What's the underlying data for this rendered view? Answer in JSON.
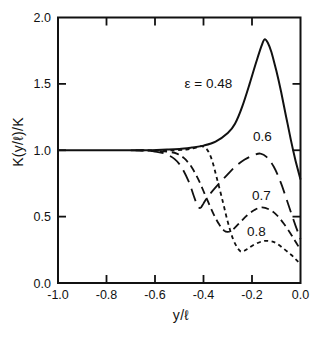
{
  "colors": {
    "ink": "#111111",
    "background": "#ffffff"
  },
  "chart_data": {
    "type": "line",
    "title": "",
    "xlabel": "y/ℓ",
    "ylabel": "K(y/ℓ)/K",
    "xlim": [
      -1.0,
      0.0
    ],
    "ylim": [
      0.0,
      2.0
    ],
    "grid": false,
    "legend_position": "inline-annotations",
    "x_ticks": [
      {
        "label": "-1.0",
        "value": -1.0
      },
      {
        "label": "-0.8",
        "value": -0.8
      },
      {
        "label": "-0.6",
        "value": -0.6
      },
      {
        "label": "-0.4",
        "value": -0.4
      },
      {
        "label": "-0.2",
        "value": -0.2
      },
      {
        "label": "0.0",
        "value": 0.0
      }
    ],
    "y_ticks": [
      {
        "label": "0.0",
        "value": 0.0
      },
      {
        "label": "0.5",
        "value": 0.5
      },
      {
        "label": "1.0",
        "value": 1.0
      },
      {
        "label": "1.5",
        "value": 1.5
      },
      {
        "label": "2.0",
        "value": 2.0
      }
    ],
    "series": [
      {
        "name": "epsilon = 0.48",
        "epsilon": 0.48,
        "style": "solid",
        "points": [
          [
            -1.0,
            1.0
          ],
          [
            -0.9,
            1.0
          ],
          [
            -0.8,
            1.0
          ],
          [
            -0.7,
            1.0
          ],
          [
            -0.62,
            1.0
          ],
          [
            -0.55,
            1.005
          ],
          [
            -0.5,
            1.01
          ],
          [
            -0.45,
            1.02
          ],
          [
            -0.4,
            1.035
          ],
          [
            -0.35,
            1.065
          ],
          [
            -0.3,
            1.13
          ],
          [
            -0.27,
            1.2
          ],
          [
            -0.24,
            1.33
          ],
          [
            -0.21,
            1.5
          ],
          [
            -0.18,
            1.68
          ],
          [
            -0.16,
            1.79
          ],
          [
            -0.148,
            1.835
          ],
          [
            -0.135,
            1.81
          ],
          [
            -0.12,
            1.74
          ],
          [
            -0.1,
            1.6
          ],
          [
            -0.08,
            1.44
          ],
          [
            -0.06,
            1.26
          ],
          [
            -0.04,
            1.08
          ],
          [
            -0.02,
            0.92
          ],
          [
            0.0,
            0.78
          ]
        ]
      },
      {
        "name": "epsilon = 0.6",
        "epsilon": 0.6,
        "style": "long-dash",
        "points": [
          [
            -0.7,
            1.0
          ],
          [
            -0.64,
            0.998
          ],
          [
            -0.6,
            0.99
          ],
          [
            -0.56,
            0.975
          ],
          [
            -0.52,
            0.935
          ],
          [
            -0.49,
            0.87
          ],
          [
            -0.46,
            0.76
          ],
          [
            -0.44,
            0.655
          ],
          [
            -0.425,
            0.585
          ],
          [
            -0.413,
            0.565
          ],
          [
            -0.4,
            0.6
          ],
          [
            -0.38,
            0.655
          ],
          [
            -0.35,
            0.72
          ],
          [
            -0.31,
            0.8
          ],
          [
            -0.27,
            0.875
          ],
          [
            -0.23,
            0.93
          ],
          [
            -0.19,
            0.965
          ],
          [
            -0.165,
            0.975
          ],
          [
            -0.14,
            0.95
          ],
          [
            -0.11,
            0.875
          ],
          [
            -0.08,
            0.75
          ],
          [
            -0.05,
            0.59
          ],
          [
            -0.02,
            0.43
          ],
          [
            0.0,
            0.33
          ]
        ]
      },
      {
        "name": "epsilon = 0.7",
        "epsilon": 0.7,
        "style": "medium-dash",
        "points": [
          [
            -0.68,
            1.0
          ],
          [
            -0.6,
            0.995
          ],
          [
            -0.55,
            0.99
          ],
          [
            -0.51,
            0.975
          ],
          [
            -0.48,
            0.94
          ],
          [
            -0.45,
            0.875
          ],
          [
            -0.42,
            0.775
          ],
          [
            -0.39,
            0.65
          ],
          [
            -0.36,
            0.525
          ],
          [
            -0.335,
            0.44
          ],
          [
            -0.315,
            0.395
          ],
          [
            -0.3,
            0.385
          ],
          [
            -0.28,
            0.4
          ],
          [
            -0.25,
            0.455
          ],
          [
            -0.22,
            0.51
          ],
          [
            -0.19,
            0.55
          ],
          [
            -0.16,
            0.57
          ],
          [
            -0.13,
            0.555
          ],
          [
            -0.1,
            0.515
          ],
          [
            -0.07,
            0.45
          ],
          [
            -0.04,
            0.37
          ],
          [
            -0.02,
            0.31
          ],
          [
            0.0,
            0.25
          ]
        ]
      },
      {
        "name": "epsilon = 0.8",
        "epsilon": 0.8,
        "style": "short-dash",
        "points": [
          [
            -0.66,
            1.0
          ],
          [
            -0.58,
            1.0
          ],
          [
            -0.52,
            1.0
          ],
          [
            -0.47,
            1.005
          ],
          [
            -0.43,
            1.02
          ],
          [
            -0.405,
            1.03
          ],
          [
            -0.385,
            1.005
          ],
          [
            -0.365,
            0.925
          ],
          [
            -0.345,
            0.79
          ],
          [
            -0.32,
            0.61
          ],
          [
            -0.3,
            0.46
          ],
          [
            -0.28,
            0.34
          ],
          [
            -0.26,
            0.265
          ],
          [
            -0.243,
            0.235
          ],
          [
            -0.22,
            0.255
          ],
          [
            -0.19,
            0.29
          ],
          [
            -0.155,
            0.315
          ],
          [
            -0.125,
            0.315
          ],
          [
            -0.1,
            0.3
          ],
          [
            -0.07,
            0.26
          ],
          [
            -0.04,
            0.215
          ],
          [
            -0.02,
            0.18
          ],
          [
            0.0,
            0.14
          ]
        ]
      }
    ],
    "annotations": [
      {
        "text": "ε = 0.48",
        "x": -0.38,
        "y": 1.5
      },
      {
        "text": "0.6",
        "x": -0.157,
        "y": 1.1
      },
      {
        "text": "0.7",
        "x": -0.161,
        "y": 0.66
      },
      {
        "text": "0.8",
        "x": -0.182,
        "y": 0.39
      }
    ]
  }
}
